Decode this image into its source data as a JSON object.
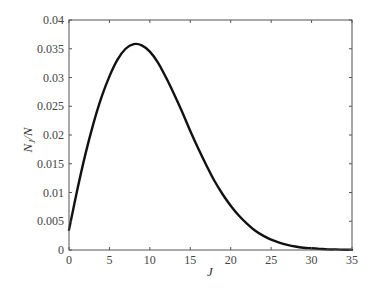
{
  "chart_data": {
    "type": "line",
    "title": "",
    "xlabel": "J",
    "ylabel": "N_J/N",
    "ylabel_main": "N",
    "ylabel_sub": "J",
    "ylabel_tail": "/N",
    "xlim": [
      0,
      35
    ],
    "ylim": [
      0,
      0.04
    ],
    "grid": false,
    "legend": null,
    "xticks": [
      0,
      5,
      10,
      15,
      20,
      25,
      30,
      35
    ],
    "xtick_labels": [
      "0",
      "5",
      "10",
      "15",
      "20",
      "25",
      "30",
      "35"
    ],
    "yticks": [
      0,
      0.005,
      0.01,
      0.015,
      0.02,
      0.025,
      0.03,
      0.035,
      0.04
    ],
    "ytick_labels": [
      "0",
      "0.005",
      "0.01",
      "0.015",
      "0.02",
      "0.025",
      "0.03",
      "0.035",
      "0.04"
    ],
    "series": [
      {
        "name": "N_J/N",
        "color": "#111111",
        "x": [
          0,
          1,
          2,
          3,
          4,
          5,
          6,
          7,
          8,
          9,
          10,
          11,
          12,
          13,
          14,
          15,
          16,
          17,
          18,
          19,
          20,
          21,
          22,
          23,
          24,
          25,
          26,
          27,
          28,
          29,
          30,
          31,
          32,
          33,
          34,
          35
        ],
        "values": [
          0.0035,
          0.0103,
          0.0165,
          0.0219,
          0.0265,
          0.0302,
          0.0331,
          0.035,
          0.0358,
          0.0356,
          0.0345,
          0.0326,
          0.03,
          0.0271,
          0.024,
          0.0207,
          0.0176,
          0.0147,
          0.012,
          0.0097,
          0.0077,
          0.006,
          0.0046,
          0.0034,
          0.0025,
          0.0018,
          0.0013,
          0.0009,
          0.0006,
          0.0004,
          0.0003,
          0.0002,
          0.0001,
          0.0001,
          5e-05,
          3e-05
        ]
      }
    ]
  }
}
